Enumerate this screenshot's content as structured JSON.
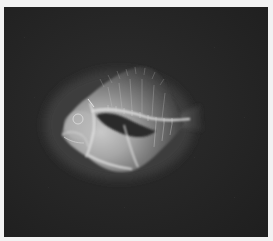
{
  "image": {
    "kind": "x-ray radiograph",
    "subject": "deep-bodied fish, lateral view, head facing left",
    "visible_structures": [
      "skull",
      "jaw",
      "vertebral column",
      "swim bladder",
      "ribs",
      "dorsal fin rays",
      "anal fin rays",
      "caudal peduncle"
    ],
    "caption": ""
  },
  "colors": {
    "margin": "#f2f2f2",
    "background": "#262626",
    "body_bright": "#d8d8d8",
    "body_mid": "#8a8a8a",
    "swim_bladder": "#2e2e2e",
    "bone": "#efefef"
  }
}
